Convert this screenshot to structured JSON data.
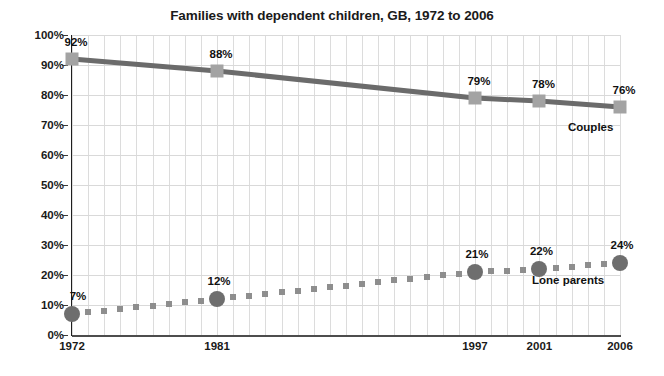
{
  "chart_data": {
    "type": "line",
    "title": "Families with dependent children, GB, 1972 to 2006",
    "xlabel": "",
    "ylabel": "",
    "xlim": [
      1972,
      2006
    ],
    "ylim": [
      0,
      100
    ],
    "grid": true,
    "legend_position": "inline-right",
    "x": [
      1972,
      1981,
      1997,
      2001,
      2006
    ],
    "xtick_labels": [
      "1972",
      "1981",
      "1997",
      "2001",
      "2006"
    ],
    "ytick_labels": [
      "0%",
      "10%",
      "20%",
      "30%",
      "40%",
      "50%",
      "60%",
      "70%",
      "80%",
      "90%",
      "100%"
    ],
    "ytick_values": [
      0,
      10,
      20,
      30,
      40,
      50,
      60,
      70,
      80,
      90,
      100
    ],
    "series": [
      {
        "name": "Couples",
        "label": "Couples",
        "marker": "square",
        "line_style": "solid",
        "color": "#6b6b6b",
        "marker_color": "#a3a3a3",
        "values": [
          92,
          88,
          79,
          78,
          76
        ],
        "point_labels": [
          "92%",
          "88%",
          "79%",
          "78%",
          "76%"
        ]
      },
      {
        "name": "Lone parents",
        "label": "Lone parents",
        "marker": "circle",
        "line_style": "dotted",
        "color": "#8e8e8e",
        "marker_color": "#6e6e6e",
        "values": [
          7,
          12,
          21,
          22,
          24
        ],
        "point_labels": [
          "7%",
          "12%",
          "21%",
          "22%",
          "24%"
        ]
      }
    ]
  },
  "colors": {
    "background": "#ffffff",
    "axis": "#1f1f1f",
    "gridline": "#d9d9d9",
    "text": "#1a1a1a",
    "couples_line": "#6b6b6b",
    "couples_marker": "#a3a3a3",
    "lone_line": "#8e8e8e",
    "lone_marker": "#6e6e6e"
  }
}
